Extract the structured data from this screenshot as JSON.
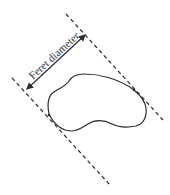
{
  "diagram": {
    "label": "Feret diameter",
    "colors": {
      "background": "#ffffff",
      "stroke": "#2b2b2b",
      "text": "#333333"
    },
    "elements": {
      "upper_tangent_line": {
        "style": "dashed",
        "x1": 66,
        "y1": 14,
        "x2": 163,
        "y2": 120
      },
      "lower_tangent_line": {
        "style": "dashed",
        "x1": 12,
        "y1": 78,
        "x2": 110,
        "y2": 185
      },
      "diameter_arrow": {
        "style": "double-headed",
        "x1": 26,
        "y1": 90,
        "x2": 86,
        "y2": 34
      },
      "particle_outline": {
        "shape": "irregular closed blob"
      }
    }
  }
}
